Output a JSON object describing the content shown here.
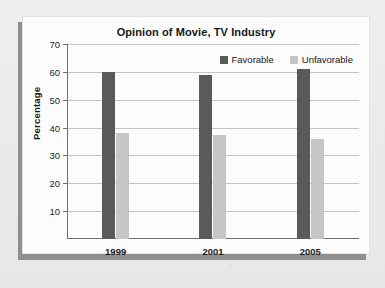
{
  "chart_data": {
    "type": "bar",
    "title": "Opinion of Movie, TV Industry",
    "xlabel": "",
    "ylabel": "Percentage",
    "categories": [
      "1999",
      "2001",
      "2005"
    ],
    "series": [
      {
        "name": "Favorable",
        "color": "#5a5a5a",
        "values": [
          60,
          59,
          61
        ]
      },
      {
        "name": "Unfavorable",
        "color": "#c6c6c6",
        "values": [
          38,
          37.5,
          36
        ]
      }
    ],
    "ylim": [
      0,
      70
    ],
    "yticks": [
      10,
      20,
      30,
      40,
      50,
      60,
      70
    ],
    "ytick_labels": [
      "10",
      "20",
      "30",
      "40",
      "50",
      "60",
      "70"
    ],
    "grid": "horizontal",
    "legend_position": "top-right-inside"
  },
  "colors": {
    "page_background": "#ebebeb",
    "card_background": "#fcfcfc",
    "shadow": "#8f8f8f",
    "axis": "#6e6e6e",
    "gridline": "#c4c4c4",
    "text": "#17171a"
  }
}
